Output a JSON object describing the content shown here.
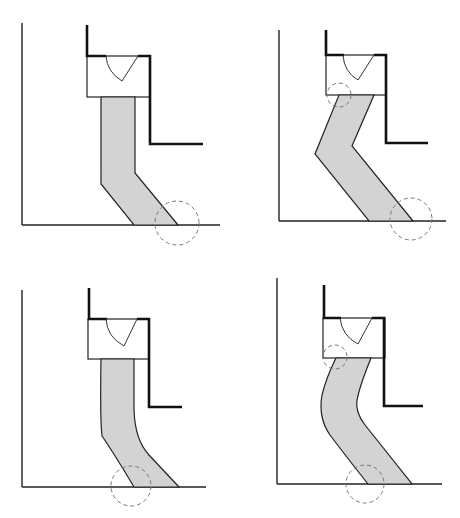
{
  "figure": {
    "header_text": "",
    "panels": [
      {
        "id": "top-left",
        "band_shape": "straight-then-angled",
        "highlight_circles": [
          "bottom-outlet"
        ]
      },
      {
        "id": "top-right",
        "band_shape": "bent-zigzag",
        "highlight_circles": [
          "top-inlet",
          "bottom-outlet"
        ]
      },
      {
        "id": "bottom-left",
        "band_shape": "straight-then-curved",
        "highlight_circles": [
          "bottom-inlet"
        ]
      },
      {
        "id": "bottom-right",
        "band_shape": "s-curve",
        "highlight_circles": [
          "top-inlet",
          "bottom-inlet"
        ]
      }
    ],
    "colors": {
      "band_fill": "#d3d3d3",
      "outline": "#222222",
      "circle_dash": "#777777",
      "background": "#ffffff"
    }
  }
}
